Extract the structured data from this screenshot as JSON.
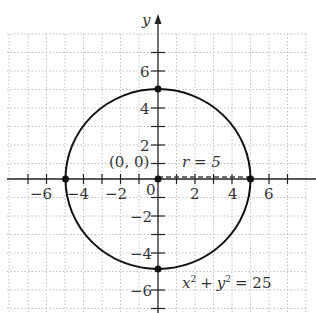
{
  "diagram": {
    "axes": {
      "x_label": "",
      "y_label": "y",
      "x_ticks": [
        "−6",
        "−4",
        "−2",
        "0",
        "2",
        "4",
        "6"
      ],
      "y_ticks": [
        "6",
        "4",
        "2",
        "−2",
        "−4",
        "−6"
      ]
    },
    "circle": {
      "center": [
        0,
        0
      ],
      "radius": 5,
      "equation": "x² + y² = 25"
    },
    "labels": {
      "center_label": "(0, 0)",
      "radius_label": "r = 5",
      "origin_label": "0",
      "equation_x": "x",
      "equation_y": "y",
      "equation_sq": "2",
      "equation_plus": "+",
      "equation_eq": "= 25"
    },
    "points": [
      [
        0,
        5
      ],
      [
        0,
        -5
      ],
      [
        5,
        0
      ],
      [
        -5,
        0
      ],
      [
        0,
        0
      ]
    ],
    "colors": {
      "ink": "#111111",
      "grid": "#b0b0b0",
      "text": "#333333"
    }
  }
}
